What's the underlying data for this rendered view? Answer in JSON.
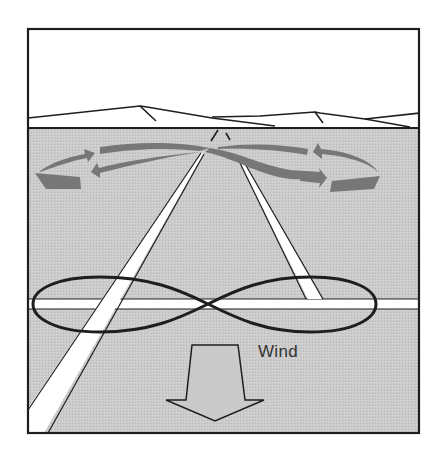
{
  "diagram": {
    "title": "",
    "wind_label": "Wind",
    "colors": {
      "sky": "#ffffff",
      "ground": "#c9c9c9",
      "outline": "#1e1e1e",
      "runway": "#ffffff",
      "turn_arrows": "#7a7a7a",
      "wind_arrow_fill": "#c9c9c9"
    },
    "elements": [
      {
        "name": "horizon-mountains",
        "description": "Mountain ridge outline along the horizon"
      },
      {
        "name": "runway-left",
        "description": "Diagonal runway strip receding to the horizon (left)"
      },
      {
        "name": "runway-right",
        "description": "Diagonal runway strip receding to the horizon (right)"
      },
      {
        "name": "runway-crosswind",
        "description": "Horizontal runway/road strip across the ground"
      },
      {
        "name": "figure-eight-path",
        "description": "Figure-eight ground-track maneuver centered on the crossroad"
      },
      {
        "name": "turn-arrows",
        "description": "Gray curved arrows near the horizon showing the turn pattern"
      },
      {
        "name": "wind-arrow",
        "description": "Large downward arrow indicating wind direction"
      }
    ]
  }
}
